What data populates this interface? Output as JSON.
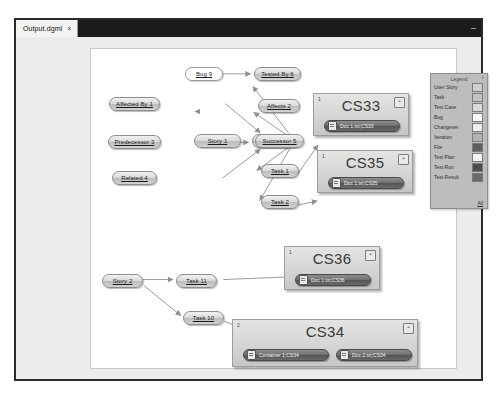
{
  "window": {
    "tab_label": "Output.dgml",
    "tab_close": "×",
    "minimize": "–"
  },
  "legend": {
    "title": "Legend",
    "collapse": "˄",
    "all_label": "All",
    "items": [
      {
        "label": "User Story",
        "color": "#cfcfcf"
      },
      {
        "label": "Task",
        "color": "#c2c2c2"
      },
      {
        "label": "Test Case",
        "color": "#d9d9d9"
      },
      {
        "label": "Bug",
        "color": "#fbfbfb"
      },
      {
        "label": "Changeset",
        "color": "#efefef"
      },
      {
        "label": "Iteration",
        "color": "#b4b4b4"
      },
      {
        "label": "File",
        "color": "#5f5f5f"
      },
      {
        "label": "Test Plan",
        "color": "#f4f4f4"
      },
      {
        "label": "Test Run",
        "color": "#4d4d4d"
      },
      {
        "label": "Test Result",
        "color": "#6b6b6b"
      }
    ]
  },
  "graph": {
    "nodes": [
      {
        "id": "bug9",
        "label": "Bug 9",
        "type": "bug"
      },
      {
        "id": "testedby6",
        "label": "Tested By 6",
        "type": "work"
      },
      {
        "id": "affectedby1",
        "label": "Affected By 1",
        "type": "work"
      },
      {
        "id": "affects2",
        "label": "Affects 2",
        "type": "work"
      },
      {
        "id": "predecessor3",
        "label": "Predecessor 3",
        "type": "work"
      },
      {
        "id": "story1",
        "label": "Story 1",
        "type": "work"
      },
      {
        "id": "successor5",
        "label": "Successor 5",
        "type": "work"
      },
      {
        "id": "related4",
        "label": "Related 4",
        "type": "work"
      },
      {
        "id": "task1",
        "label": "Task 1",
        "type": "work"
      },
      {
        "id": "task2",
        "label": "Task 2",
        "type": "work"
      },
      {
        "id": "story2",
        "label": "Story 2",
        "type": "work"
      },
      {
        "id": "task11",
        "label": "Task 11",
        "type": "work"
      },
      {
        "id": "task10",
        "label": "Task 10",
        "type": "work"
      }
    ],
    "groups": [
      {
        "id": "cs33",
        "title": "CS33",
        "count": "1",
        "expand": "⌃",
        "docs": [
          {
            "label": "Doc 1.txt;CS33"
          }
        ]
      },
      {
        "id": "cs35",
        "title": "CS35",
        "count": "1",
        "expand": "⌃",
        "docs": [
          {
            "label": "Doc 1.txt;CS35"
          }
        ]
      },
      {
        "id": "cs36",
        "title": "CS36",
        "count": "1",
        "expand": "⌃",
        "docs": [
          {
            "label": "Doc 1.txt;CS36"
          }
        ]
      },
      {
        "id": "cs34",
        "title": "CS34",
        "count": "2",
        "expand": "⌃",
        "docs": [
          {
            "label": "Container 1;CS34"
          },
          {
            "label": "Doc 2.txt;CS34"
          }
        ]
      }
    ]
  },
  "colors": {
    "titlebar": "#1c1c1c",
    "window_bg": "#ececeb",
    "canvas_bg": "#ffffff",
    "legend_bg": "#bdbdbd",
    "edge": "#9a9a9a"
  }
}
